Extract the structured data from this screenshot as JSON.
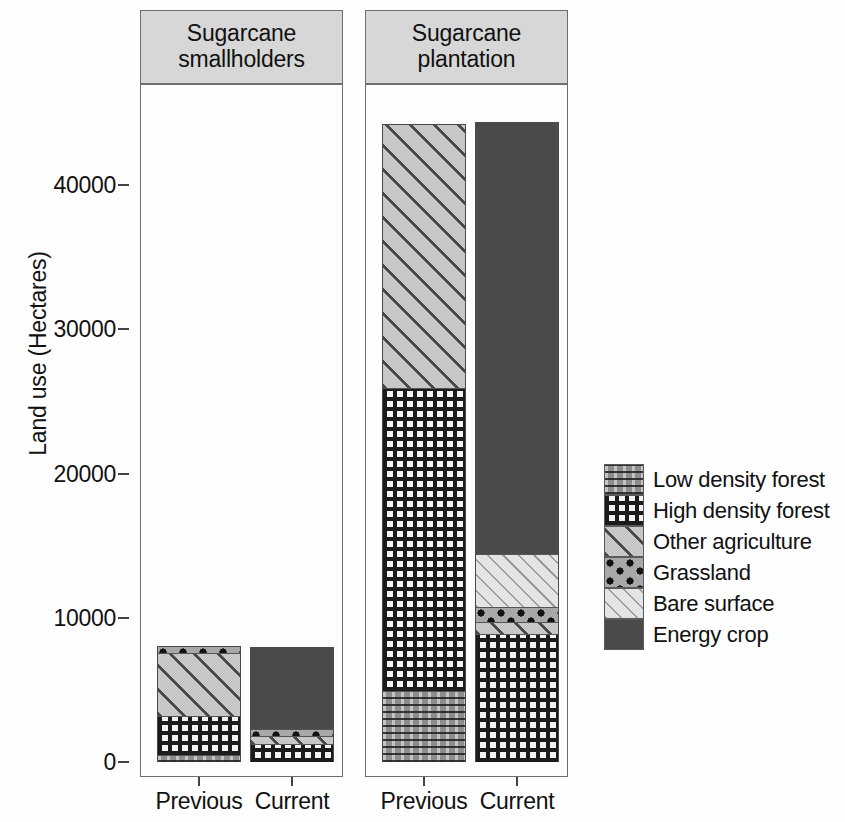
{
  "axis": {
    "ylabel": "Land use (Hectares)",
    "yticks": [
      "0",
      "10000",
      "20000",
      "30000",
      "40000"
    ],
    "ytick_values": [
      0,
      10000,
      20000,
      30000,
      40000
    ],
    "ymin": 0,
    "ymax": 44250
  },
  "panels": [
    {
      "title": "Sugarcane\nsmallholders",
      "title_line1": "Sugarcane",
      "title_line2": "smallholders"
    },
    {
      "title": "Sugarcane\nplantation",
      "title_line1": "Sugarcane",
      "title_line2": "plantation"
    }
  ],
  "xlabels": [
    "Previous",
    "Current",
    "Previous",
    "Current"
  ],
  "legend": {
    "position": "right",
    "entries": [
      {
        "label": "Low density forest",
        "key": "low_density_forest",
        "pattern": "gray-speckle",
        "color": "#8d8d8d"
      },
      {
        "label": "High density forest",
        "key": "high_density_forest",
        "pattern": "dark-grid",
        "color": "#f2f2f2"
      },
      {
        "label": "Other agriculture",
        "key": "other_agriculture",
        "pattern": "bold-diagonal",
        "color": "#c7c7c7"
      },
      {
        "label": "Grassland",
        "key": "grassland",
        "pattern": "black-dots",
        "color": "#a8a8a8"
      },
      {
        "label": "Bare surface",
        "key": "bare_surface",
        "pattern": "fine-diagonal",
        "color": "#e4e4e4"
      },
      {
        "label": "Energy crop",
        "key": "energy_crop",
        "pattern": "solid-dark",
        "color": "#4a4a4a"
      }
    ]
  },
  "chart_data": {
    "type": "bar",
    "subtype": "stacked",
    "title": "",
    "xlabel": "",
    "ylabel": "Land use (Hectares)",
    "ylim": [
      0,
      44250
    ],
    "grid": false,
    "legend_position": "right",
    "panels": [
      "Sugarcane smallholders",
      "Sugarcane plantation"
    ],
    "categories": [
      "Previous",
      "Current",
      "Previous",
      "Current"
    ],
    "series": [
      {
        "name": "Low density forest",
        "values": [
          420,
          0,
          4860,
          0
        ]
      },
      {
        "name": "High density forest",
        "values": [
          2700,
          1180,
          21040,
          8800
        ]
      },
      {
        "name": "Other agriculture",
        "values": [
          4450,
          550,
          18300,
          830
        ]
      },
      {
        "name": "Grassland",
        "values": [
          440,
          480,
          0,
          1040
        ]
      },
      {
        "name": "Bare surface",
        "values": [
          0,
          0,
          0,
          3680
        ]
      },
      {
        "name": "Energy crop",
        "values": [
          0,
          5790,
          0,
          30000
        ]
      }
    ],
    "totals": [
      8010,
      8000,
      44200,
      44350
    ]
  }
}
